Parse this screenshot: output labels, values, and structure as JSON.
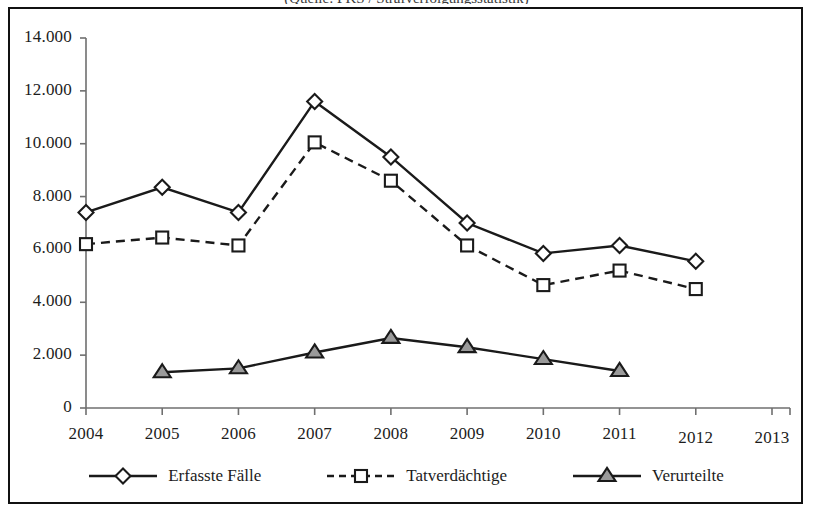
{
  "figure": {
    "caption_sliver": "(Quelle: PKS / Strafverfolgungsstatistik)",
    "border_color": "#111111",
    "background_color": "#ffffff"
  },
  "chart_data": {
    "type": "line",
    "title": "",
    "subtitle": "",
    "xlabel": "",
    "ylabel": "",
    "grid": false,
    "legend_position": "bottom",
    "categories": [
      "2004",
      "2005",
      "2006",
      "2007",
      "2008",
      "2009",
      "2010",
      "2011",
      "2012",
      "2013"
    ],
    "x": [
      2004,
      2005,
      2006,
      2007,
      2008,
      2009,
      2010,
      2011,
      2012,
      2013
    ],
    "xlim": [
      2004,
      2013
    ],
    "ylim": [
      0,
      14000
    ],
    "ytick_labels": [
      "0",
      "2.000",
      "4.000",
      "6.000",
      "8.000",
      "10.000",
      "12.000",
      "14.000"
    ],
    "ytick_values": [
      0,
      2000,
      4000,
      6000,
      8000,
      10000,
      12000,
      14000
    ],
    "series": [
      {
        "name": "Erfasste Fälle",
        "marker": "diamond",
        "line_style": "solid",
        "color": "#1a1a1a",
        "marker_fill": "#ffffff",
        "values": [
          7400,
          8350,
          7400,
          11600,
          9500,
          7000,
          5850,
          6150,
          5550,
          null
        ]
      },
      {
        "name": "Tatverdächtige",
        "marker": "square",
        "line_style": "dashed",
        "color": "#1a1a1a",
        "marker_fill": "#ffffff",
        "values": [
          6200,
          6450,
          6150,
          10050,
          8600,
          6150,
          4650,
          5200,
          4500,
          null
        ]
      },
      {
        "name": "Verurteilte",
        "marker": "triangle",
        "line_style": "solid",
        "color": "#1a1a1a",
        "marker_fill": "#9a9a9a",
        "values": [
          null,
          1350,
          1500,
          2100,
          2650,
          2300,
          1850,
          1400,
          null,
          null
        ]
      }
    ]
  },
  "legend": {
    "items": [
      {
        "label": "Erfasste Fälle",
        "marker": "diamond-icon",
        "style": "solid"
      },
      {
        "label": "Tatverdächtige",
        "marker": "square-icon",
        "style": "dashed"
      },
      {
        "label": "Verurteilte",
        "marker": "triangle-icon",
        "style": "solid"
      }
    ]
  }
}
